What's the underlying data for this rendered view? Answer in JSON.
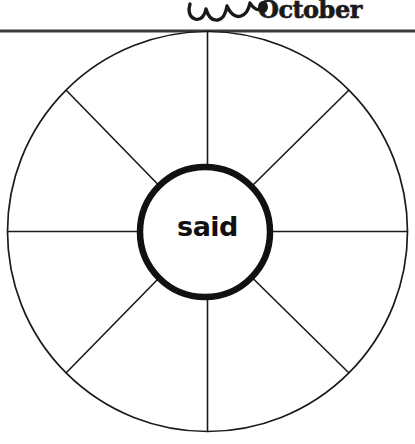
{
  "worksheet": {
    "title": "Word Wheel",
    "month_label": "October",
    "hub_word": "said",
    "sector_count": 8,
    "sector_labels": [
      "",
      "",
      "",
      "",
      "",
      "",
      "",
      ""
    ],
    "divider_rule": {
      "name": "horizontal-rule",
      "color": "#3a3a3a"
    },
    "decoration": {
      "name": "scalloped-bat-wing-doodle",
      "description": "hand-drawn scalloped wavy line"
    }
  },
  "colors": {
    "ink": "#1a1a1a",
    "rule": "#3a3a3a",
    "paper": "#ffffff",
    "hub_stroke": "#111111"
  },
  "geometry": {
    "outer_circle": {
      "cx": 207.5,
      "cy": 231.5,
      "r": 200
    },
    "inner_circle": {
      "cx": 205,
      "cy": 232,
      "r": 66
    },
    "rule_y": 31
  }
}
